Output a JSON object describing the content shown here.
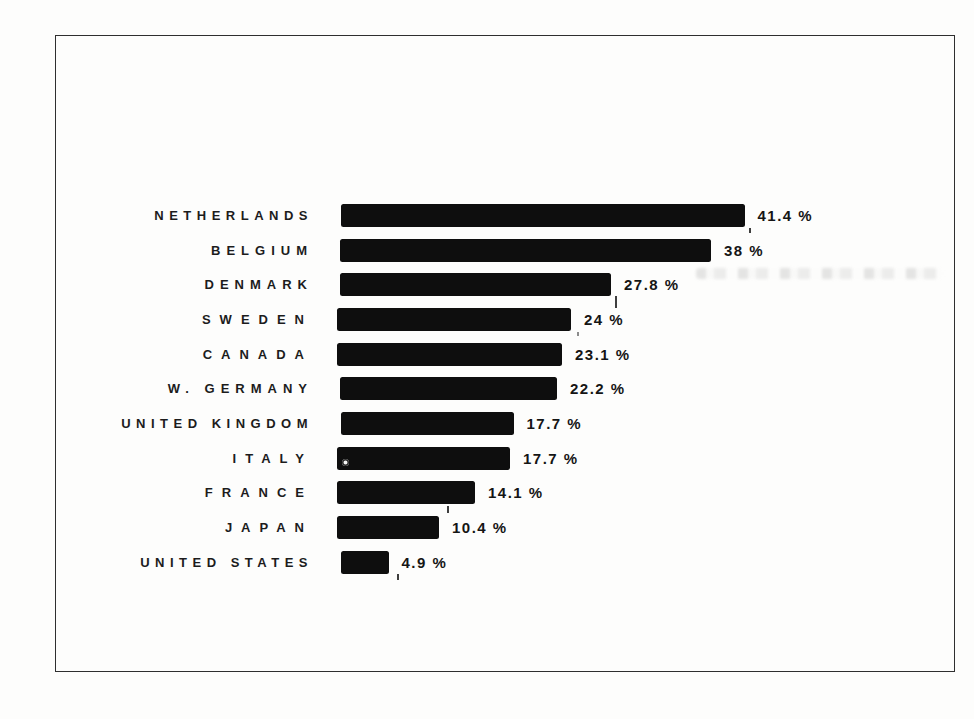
{
  "page": {
    "kind": "scanned-statistical-chart",
    "background_color": "#fdfdfc",
    "frame_border_color": "#2f2f2f",
    "ink_color": "#0e0e0e"
  },
  "chart_data": {
    "type": "bar",
    "orientation": "horizontal",
    "title": "",
    "xlabel": "",
    "ylabel": "",
    "unit": "%",
    "xlim": [
      0,
      45
    ],
    "grid": false,
    "legend": false,
    "bar_color": "#0e0e0e",
    "categories": [
      "NETHERLANDS",
      "BELGIUM",
      "DENMARK",
      "SWEDEN",
      "CANADA",
      "W. GERMANY",
      "UNITED KINGDOM",
      "ITALY",
      "FRANCE",
      "JAPAN",
      "UNITED STATES"
    ],
    "values": [
      41.4,
      38,
      27.8,
      24,
      23.1,
      22.2,
      17.7,
      17.7,
      14.1,
      10.4,
      4.9
    ],
    "value_labels": [
      "41.4 %",
      "38 %",
      "27.8 %",
      "24 %",
      "23.1 %",
      "22.2 %",
      "17.7 %",
      "17.7 %",
      "14.1 %",
      "10.4 %",
      "4.9 %"
    ]
  }
}
